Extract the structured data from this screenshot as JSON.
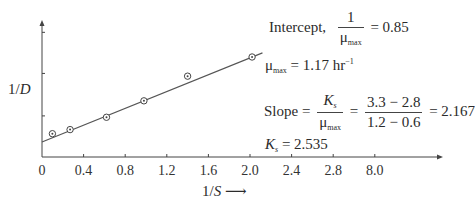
{
  "chart_data": {
    "type": "scatter",
    "title": "",
    "xlabel": "1/S",
    "ylabel": "1/D",
    "x_tick_labels": [
      "0",
      "0.4",
      "0.8",
      "1.2",
      "1.6",
      "2.0",
      "2.4",
      "2.8",
      "8.0"
    ],
    "x_tick_positions": [
      0,
      0.4,
      0.8,
      1.2,
      1.6,
      2.0,
      2.4,
      2.8,
      3.2
    ],
    "y_tick_labels": [],
    "y_ticks_relative": [
      0.3,
      0.61,
      0.91
    ],
    "xlim": [
      0,
      3.85
    ],
    "grid": false,
    "legend": null,
    "series": [
      {
        "name": "data",
        "marker": "circle-dot",
        "x": [
          0.1,
          0.27,
          0.62,
          0.98,
          1.4,
          2.02
        ],
        "y_relative": [
          0.17,
          0.2,
          0.29,
          0.41,
          0.59,
          0.73
        ]
      },
      {
        "name": "fit",
        "type": "line",
        "x": [
          0,
          2.12
        ],
        "y_relative": [
          0.11,
          0.76
        ]
      }
    ],
    "annotations": {
      "intercept_label": "Intercept,",
      "intercept_num": "1",
      "intercept_den": "μ",
      "intercept_den_sub": "max",
      "intercept_value": "= 0.85",
      "mumax_symbol": "μ",
      "mumax_sub": "max",
      "mumax_value": "= 1.17 hr",
      "mumax_sup": "−1",
      "slope_label": "Slope =",
      "slope_num": "K",
      "slope_num_sub": "s",
      "slope_den": "μ",
      "slope_den_sub": "max",
      "slope_eq": "=",
      "slope_calc_num": "3.3 − 2.8",
      "slope_calc_den": "1.2 − 0.6",
      "slope_value": "= 2.167",
      "ks_symbol": "K",
      "ks_sub": "s",
      "ks_value": "= 2.535"
    },
    "x_arrow_label": "⟶",
    "colors": {
      "axis": "#444444",
      "line": "#555555",
      "marker": "#444444",
      "text": "#2b2b2b"
    }
  }
}
